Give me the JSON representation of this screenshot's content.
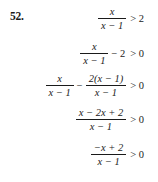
{
  "problem": {
    "number_label": "52.",
    "type": "rational-inequality-solution-steps",
    "steps": [
      {
        "id": "step-1",
        "plain": "x/(x-1) > 2",
        "left": {
          "kind": "fraction",
          "numerator": "x",
          "denominator": "x − 1"
        },
        "relation": "> 2"
      },
      {
        "id": "step-2",
        "plain": "x/(x-1) - 2 > 0",
        "left": {
          "kind": "fraction",
          "numerator": "x",
          "denominator": "x − 1"
        },
        "operator": "− 2",
        "relation": "> 0"
      },
      {
        "id": "step-3",
        "plain": "x/(x-1) - 2(x-1)/(x-1) > 0",
        "left": {
          "kind": "fraction",
          "numerator": "x",
          "denominator": "x − 1"
        },
        "operator": "−",
        "right": {
          "kind": "fraction",
          "numerator": "2(x − 1)",
          "denominator": "x − 1"
        },
        "relation": "> 0"
      },
      {
        "id": "step-4",
        "plain": "(x - 2x + 2)/(x - 1) > 0",
        "left": {
          "kind": "fraction",
          "numerator": "x − 2x + 2",
          "denominator": "x − 1"
        },
        "relation": "> 0"
      },
      {
        "id": "step-5",
        "plain": "(-x + 2)/(x - 1) > 0",
        "left": {
          "kind": "fraction",
          "numerator": "−x + 2",
          "denominator": "x − 1"
        },
        "relation": "> 0"
      }
    ]
  },
  "colors": {
    "background": "#ffffff",
    "text": "#1a1a1a",
    "rule": "#1a1a1a"
  }
}
